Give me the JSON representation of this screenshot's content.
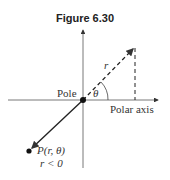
{
  "figure": {
    "title": "Figure 6.30",
    "labels": {
      "pole": "Pole",
      "theta": "θ",
      "r": "r",
      "polar_axis": "Polar axis",
      "point": "P(r, θ)",
      "condition": "r < 0"
    }
  }
}
